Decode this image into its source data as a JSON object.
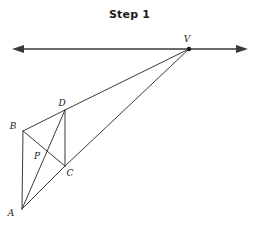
{
  "figure": {
    "title": "Step 1",
    "width": 259,
    "height": 227,
    "background": "#ffffff",
    "stroke_color": "#3a3a3a",
    "label_color": "#1a1a1a",
    "stroke_width": 1
  },
  "points": {
    "A": {
      "label": "A",
      "x": 22,
      "y": 209,
      "label_x": 11,
      "label_y": 216
    },
    "B": {
      "label": "B",
      "x": 23,
      "y": 131,
      "label_x": 13,
      "label_y": 129
    },
    "C": {
      "label": "C",
      "x": 65,
      "y": 166,
      "label_x": 67,
      "label_y": 176
    },
    "D": {
      "label": "D",
      "x": 65,
      "y": 110,
      "label_x": 59,
      "label_y": 106
    },
    "P": {
      "label": "P",
      "x": 43,
      "y": 152,
      "label_x": 34,
      "label_y": 159
    },
    "V": {
      "label": "V",
      "x": 189,
      "y": 49,
      "label_x": 185,
      "label_y": 42
    }
  },
  "horizontal_line": {
    "name": "double-headed-horizontal-line",
    "left_tip_x": 12,
    "right_tip_x": 248,
    "y": 49,
    "arrow_left": true,
    "arrow_right": true
  },
  "segments": [
    {
      "name": "segment-AB",
      "from": "A",
      "to": "B"
    },
    {
      "name": "segment-BD",
      "from": "B",
      "to": "D"
    },
    {
      "name": "segment-DC",
      "from": "D",
      "to": "C"
    },
    {
      "name": "segment-BC",
      "from": "B",
      "to": "C"
    },
    {
      "name": "segment-AD",
      "from": "A",
      "to": "D"
    },
    {
      "name": "segment-AC",
      "from": "A",
      "to": "C"
    },
    {
      "name": "segment-DV",
      "from": "D",
      "to": "V"
    },
    {
      "name": "segment-CV",
      "from": "C",
      "to": "V"
    }
  ]
}
